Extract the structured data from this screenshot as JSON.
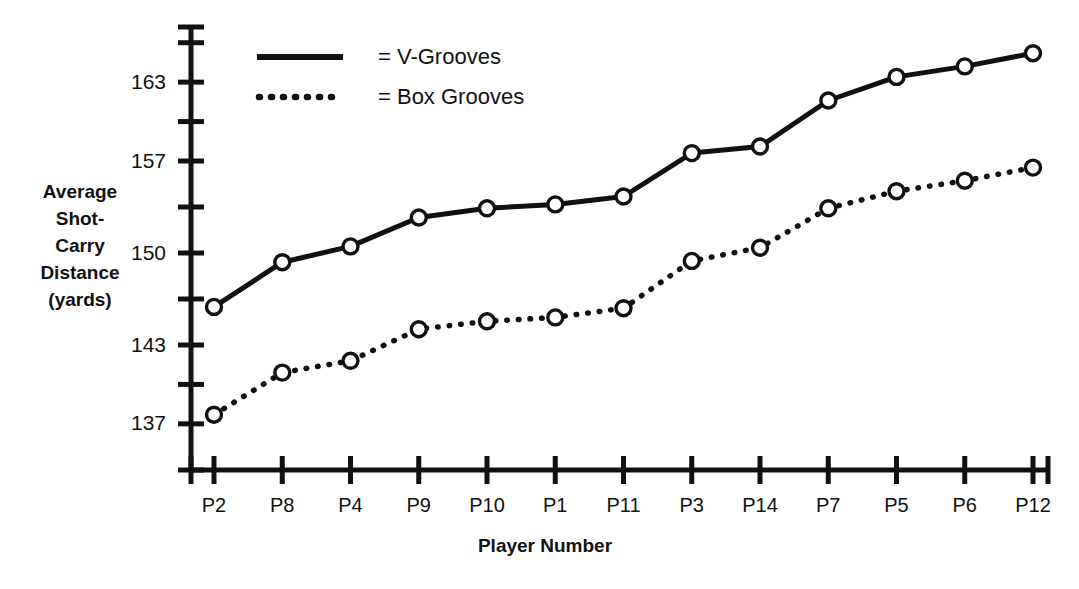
{
  "chart_data": {
    "type": "line",
    "title": "",
    "xlabel": "Player Number",
    "ylabel": "Average Shot-Carry Distance (yards)",
    "categories": [
      "P2",
      "P8",
      "P4",
      "P9",
      "P10",
      "P1",
      "P11",
      "P3",
      "P14",
      "P7",
      "P5",
      "P6",
      "P12"
    ],
    "ylim": [
      133.8,
      166.5
    ],
    "y_ticks_major": [
      137,
      143,
      150,
      157,
      163
    ],
    "y_ticks_minor": [
      140,
      146.5,
      153.5,
      160,
      166
    ],
    "grid": false,
    "legend_position": "top-left-inside",
    "series": [
      {
        "name": "V-Grooves",
        "style": "solid",
        "marker": "open-circle",
        "values": [
          145.9,
          149.3,
          150.5,
          152.7,
          153.4,
          153.7,
          154.3,
          157.6,
          158.1,
          161.6,
          163.4,
          164.2,
          165.2
        ]
      },
      {
        "name": "Box Grooves",
        "style": "dotted",
        "marker": "open-circle",
        "values": [
          137.7,
          140.9,
          141.8,
          144.2,
          144.8,
          145.1,
          145.8,
          149.4,
          150.4,
          153.4,
          154.7,
          155.5,
          156.5
        ]
      }
    ]
  },
  "axis": {
    "y_title_lines": [
      "Average",
      "Shot-",
      "Carry",
      "Distance",
      "(yards)"
    ],
    "x_title": "Player Number",
    "y_tick_labels": [
      "163",
      "157",
      "150",
      "143",
      "137"
    ],
    "x_tick_labels": [
      "P2",
      "P8",
      "P4",
      "P9",
      "P10",
      "P1",
      "P11",
      "P3",
      "P14",
      "P7",
      "P5",
      "P6",
      "P12"
    ]
  },
  "legend": {
    "entries": [
      {
        "label": "= V-Grooves",
        "style": "solid"
      },
      {
        "label": "= Box Grooves",
        "style": "dotted"
      }
    ]
  },
  "colors": {
    "ink": "#111111",
    "background": "#ffffff",
    "marker_fill": "#ffffff"
  }
}
